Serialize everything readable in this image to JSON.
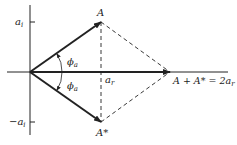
{
  "diagram": {
    "type": "phasor-diagram",
    "labels": {
      "A": "A",
      "A_conj": "A*",
      "sum": "A + A* = 2a",
      "sum_sub": "r",
      "ai_top": "a",
      "ai_top_sub": "i",
      "ai_bottom": "−a",
      "ai_bottom_sub": "i",
      "ar": "a",
      "ar_sub": "r",
      "phi_top": "ϕ",
      "phi_top_sub": "a",
      "phi_bottom": "ϕ",
      "phi_bottom_sub": "a"
    },
    "colors": {
      "stroke": "#222222",
      "background": "#ffffff"
    }
  }
}
